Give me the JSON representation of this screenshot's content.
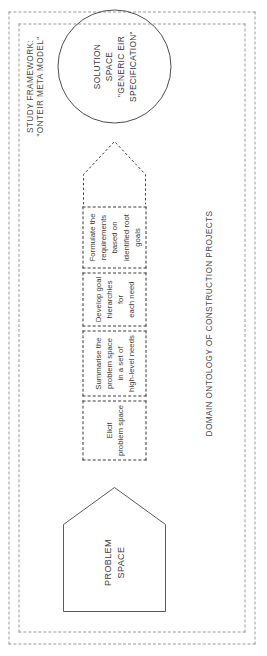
{
  "diagram": {
    "frames": {
      "study_framework_label": "STUDY FRAMEWORK:\n\"ONTEIR META MODEL\"",
      "domain_ontology_label": "DOMAIN ONTOLOGY OF CONSTRUCTION PROJECTS"
    },
    "problem_space": {
      "label": "PROBLEM\nSPACE",
      "shape": "pentagon"
    },
    "solution_space": {
      "label": "SOLUTION\nSPACE\n\"GENERIC EIR\nSPECIFICATION\"",
      "shape": "circle"
    },
    "process_steps": [
      {
        "label": "Elicit\nproblem space"
      },
      {
        "label": "Summarise the\nproblem space\nin a set of\nhigh-level needs"
      },
      {
        "label": "Develop goal\nhierarchies for\neach need"
      },
      {
        "label": "Formulate the\nrequirements\nbased on\nidentified root\ngoals"
      }
    ],
    "arrow": {
      "name": "chevron-arrow",
      "direction": "toward-solution-space"
    },
    "colors": {
      "stroke_solid": "#4d4d4d",
      "stroke_dashed": "#3a3a3a",
      "frame_dashed": "#9a9a9a",
      "text": "#3a3a3a",
      "background": "#ffffff"
    }
  }
}
